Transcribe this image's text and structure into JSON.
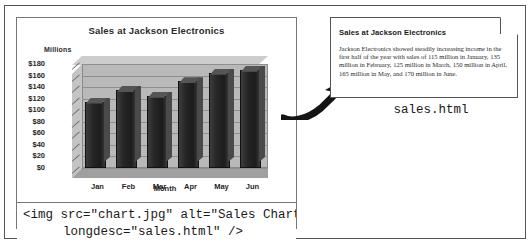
{
  "figure": {
    "code_snippet": {
      "line1": "<img src=\"chart.jpg\" alt=\"Sales Chart\"",
      "line2": "longdesc=\"sales.html\" />"
    },
    "caption": "sales.html",
    "arrow_icon": "curved-arrow-icon",
    "dogear_icon": "page-dogear-icon"
  },
  "chart_data": {
    "type": "bar",
    "title": "Sales at Jackson Electronics",
    "xlabel": "Month",
    "ylabel": "Millions",
    "categories": [
      "Jan",
      "Feb",
      "Mar",
      "Apr",
      "May",
      "Jun"
    ],
    "values": [
      115,
      135,
      125,
      150,
      165,
      170
    ],
    "ylim": [
      0,
      180
    ],
    "ytick_labels": [
      "$180",
      "$160",
      "$140",
      "$120",
      "$100",
      "$80",
      "$60",
      "$40",
      "$20",
      "$0"
    ],
    "ytick_values": [
      180,
      160,
      140,
      120,
      100,
      80,
      60,
      40,
      20,
      0
    ],
    "grid": true,
    "legend": false,
    "style_3d": true,
    "bar_color": "#262626",
    "wall_color": "#b9b9b9"
  },
  "html_page": {
    "title": "Sales at Jackson Electronics",
    "paragraph": "Jackson Electronics showed steadily increasing income in the first half of the year with sales of 115 million in January, 135 million in February, 125 million in March, 150 million in April, 165 million in May, and 170 million in June."
  }
}
